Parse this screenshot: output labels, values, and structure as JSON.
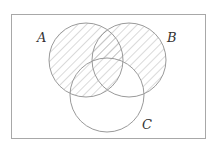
{
  "diagram": {
    "type": "venn",
    "universe": {
      "x": 11,
      "y": 14,
      "width": 194,
      "height": 124
    },
    "sets": [
      {
        "name": "A",
        "label": "A",
        "cx": 86,
        "cy": 60,
        "r": 37,
        "label_x": 37,
        "label_y": 42
      },
      {
        "name": "B",
        "label": "B",
        "cx": 129,
        "cy": 60,
        "r": 37,
        "label_x": 167,
        "label_y": 42
      },
      {
        "name": "C",
        "label": "C",
        "cx": 107,
        "cy": 95,
        "r": 37,
        "label_x": 142,
        "label_y": 129
      }
    ],
    "shaded_region": "A ∪ (B − C)",
    "colors": {
      "outline": "#9a9a9a",
      "hatch": "#b5b5b5",
      "border": "#a8a8a8",
      "text": "#333333"
    }
  }
}
